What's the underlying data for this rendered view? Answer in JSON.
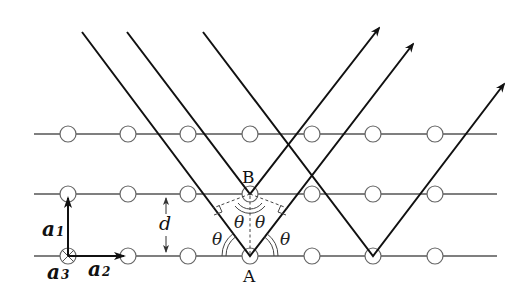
{
  "diagram": {
    "labels": {
      "point_a": "A",
      "point_b": "B",
      "spacing": "d",
      "angle": "θ",
      "vector_a1": "a",
      "vector_a1_sub": "1",
      "vector_a2": "a",
      "vector_a2_sub": "2",
      "vector_a3": "a",
      "vector_a3_sub": "3"
    },
    "lattice": {
      "rows": 3,
      "atoms_per_row": 7,
      "row_y": [
        134,
        194,
        256
      ],
      "atom_x": [
        68,
        128,
        188,
        250,
        312,
        373,
        435
      ]
    },
    "rays": [
      {
        "name": "ray-1",
        "reflects_at": "A"
      },
      {
        "name": "ray-2",
        "reflects_at": "B"
      },
      {
        "name": "ray-3",
        "reflects_at": "lower-plane-atom-6"
      }
    ],
    "colors": {
      "ray": "#111111",
      "lattice": "#555555",
      "atom_fill": "#ffffff"
    }
  }
}
